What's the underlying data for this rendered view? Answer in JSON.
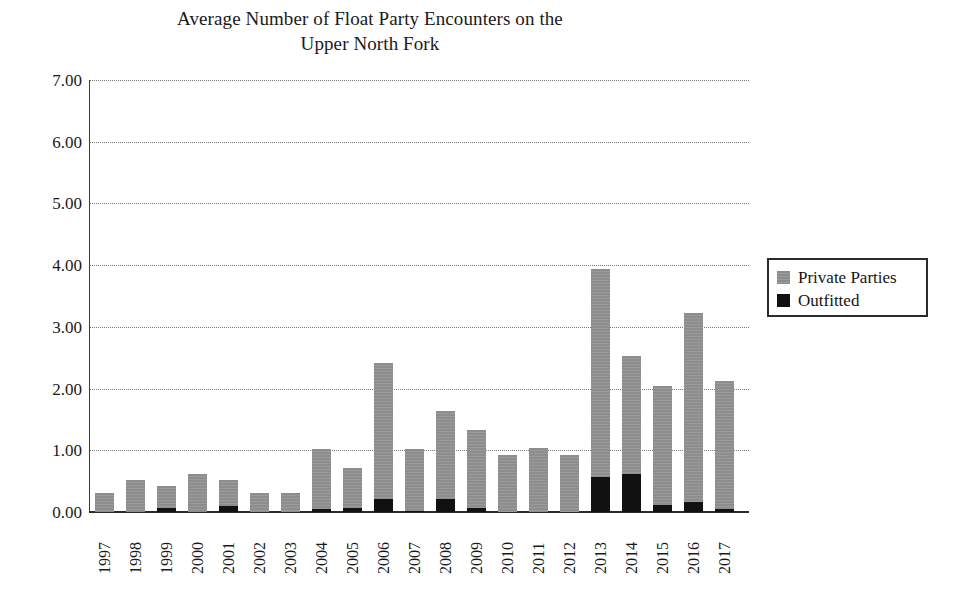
{
  "chart_data": {
    "type": "bar",
    "title": "Average Number of Float Party Encounters on the Upper North Fork",
    "title_line1": "Average Number of Float Party Encounters on the",
    "title_line2": "Upper North Fork",
    "stacked": true,
    "xlabel": "",
    "ylabel": "",
    "ylim": [
      0,
      7
    ],
    "ytick_step": 1,
    "ytick_labels": [
      "7.00",
      "6.00",
      "5.00",
      "4.00",
      "3.00",
      "2.00",
      "1.00",
      "0.00"
    ],
    "ytick_values": [
      7,
      6,
      5,
      4,
      3,
      2,
      1,
      0
    ],
    "grid": true,
    "grid_style": "dotted",
    "grid_axis": "y",
    "legend_position": "right",
    "categories": [
      "1997",
      "1998",
      "1999",
      "2000",
      "2001",
      "2002",
      "2003",
      "2004",
      "2005",
      "2006",
      "2007",
      "2008",
      "2009",
      "2010",
      "2011",
      "2012",
      "2013",
      "2014",
      "2015",
      "2016",
      "2017"
    ],
    "series": [
      {
        "name": "Outfitted",
        "color": "#111111",
        "values": [
          0.0,
          0.0,
          0.06,
          0.0,
          0.09,
          0.0,
          0.0,
          0.05,
          0.06,
          0.21,
          0.02,
          0.21,
          0.07,
          0.0,
          0.0,
          0.0,
          0.57,
          0.61,
          0.11,
          0.16,
          0.05
        ]
      },
      {
        "name": "Private Parties",
        "color": "#959595",
        "values": [
          0.31,
          0.52,
          0.36,
          0.61,
          0.43,
          0.31,
          0.31,
          0.97,
          0.65,
          2.21,
          1.0,
          1.42,
          1.26,
          0.93,
          1.03,
          0.92,
          3.36,
          1.92,
          1.93,
          3.07,
          2.08
        ]
      }
    ],
    "totals": [
      0.31,
      0.52,
      0.42,
      0.61,
      0.52,
      0.31,
      0.31,
      1.02,
      0.71,
      2.42,
      1.02,
      1.63,
      1.33,
      0.93,
      1.03,
      0.92,
      3.93,
      2.53,
      2.04,
      3.23,
      2.13
    ]
  },
  "legend": {
    "items": [
      {
        "label": "Private Parties",
        "swatch": "private"
      },
      {
        "label": "Outfitted",
        "swatch": "outfitted"
      }
    ]
  }
}
